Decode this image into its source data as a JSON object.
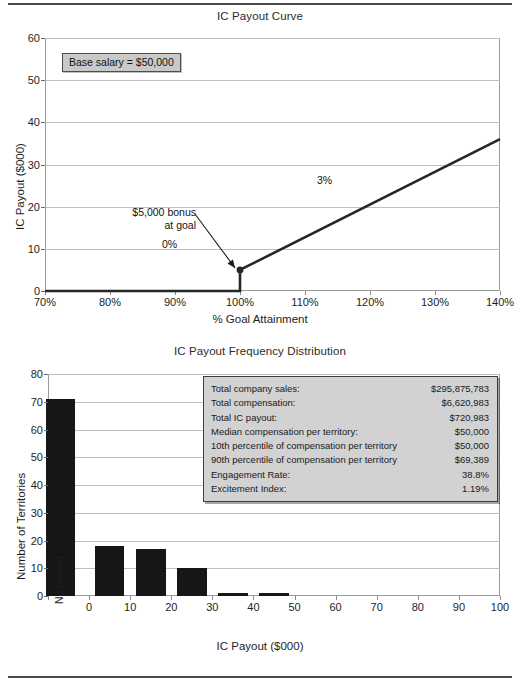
{
  "chart_data": [
    {
      "type": "line",
      "title": "IC Payout Curve",
      "xlabel": "% Goal Attainment",
      "ylabel": "IC Payout ($000)",
      "xlim": [
        70,
        140
      ],
      "ylim": [
        0,
        60
      ],
      "xticks": [
        "70%",
        "80%",
        "90%",
        "100%",
        "110%",
        "120%",
        "130%",
        "140%"
      ],
      "xtick_values": [
        70,
        80,
        90,
        100,
        110,
        120,
        130,
        140
      ],
      "yticks": [
        "0",
        "10",
        "20",
        "30",
        "40",
        "50",
        "60"
      ],
      "ytick_values": [
        0,
        10,
        20,
        30,
        40,
        50,
        60
      ],
      "grid": true,
      "legend": "none",
      "series": [
        {
          "name": "IC Payout",
          "points": [
            [
              70,
              0
            ],
            [
              100,
              0
            ],
            [
              100,
              5
            ],
            [
              140,
              36
            ]
          ]
        }
      ],
      "marker_point": [
        100,
        5
      ],
      "annotations": {
        "callout": "Base salary = $50,000",
        "bonus_line1": "$5,000 bonus",
        "bonus_line2": "at goal",
        "flat_rate": "0%",
        "slope_rate": "3%"
      }
    },
    {
      "type": "bar",
      "title": "IC Payout Frequency Distribution",
      "xlabel": "IC Payout ($000)",
      "ylabel": "Number of Territories",
      "xlim": [
        -10,
        100
      ],
      "ylim": [
        0,
        80
      ],
      "xticks": [
        "No payout",
        "0",
        "10",
        "20",
        "30",
        "40",
        "50",
        "60",
        "70",
        "80",
        "90",
        "100"
      ],
      "xtick_values": [
        -10,
        0,
        10,
        20,
        30,
        40,
        50,
        60,
        70,
        80,
        90,
        100
      ],
      "yticks": [
        "0",
        "10",
        "20",
        "30",
        "40",
        "50",
        "60",
        "70",
        "80"
      ],
      "ytick_values": [
        0,
        10,
        20,
        30,
        40,
        50,
        60,
        70,
        80
      ],
      "grid": true,
      "legend": "none",
      "categories": [
        "No payout",
        "0-10",
        "10-20",
        "20-30",
        "30-40",
        "40-50"
      ],
      "bar_centers": [
        -7,
        5,
        15,
        25,
        35,
        45
      ],
      "values": [
        71,
        18,
        17,
        10,
        1,
        1
      ],
      "stats": {
        "rows": [
          {
            "key": "Total company sales:",
            "value": "$295,875,783"
          },
          {
            "key": "Total compensation:",
            "value": "$6,620,983"
          },
          {
            "key": "Total IC payout:",
            "value": "$720,983"
          },
          {
            "key": "Median compensation per territory:",
            "value": "$50,000"
          },
          {
            "key": "10th percentile of compensation per territory",
            "value": "$50,000"
          },
          {
            "key": "90th percentile of compensation per territory",
            "value": "$69,389"
          },
          {
            "key": "Engagement Rate:",
            "value": "38.8%"
          },
          {
            "key": "Excitement Index:",
            "value": "1.19%"
          }
        ]
      }
    }
  ],
  "colors": {
    "bar_fill": "#161616",
    "line": "#262626",
    "grid": "#bfbfbf",
    "callout_fill": "#c9c9c9",
    "stats_fill": "#d2d2d2",
    "rule": "#4a4a4a"
  }
}
